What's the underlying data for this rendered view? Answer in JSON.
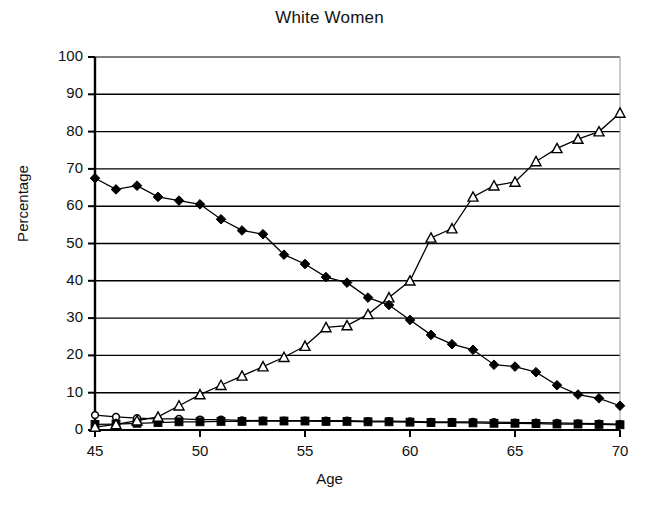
{
  "chart_data": {
    "type": "line",
    "title": "White Women",
    "xlabel": "Age",
    "ylabel": "Percentage",
    "xlim": [
      45,
      70
    ],
    "ylim": [
      0,
      100
    ],
    "xticks": [
      45,
      50,
      55,
      60,
      65,
      70
    ],
    "yticks": [
      0,
      10,
      20,
      30,
      40,
      50,
      60,
      70,
      80,
      90,
      100
    ],
    "grid": true,
    "legend": "none",
    "x": [
      45,
      46,
      47,
      48,
      49,
      50,
      51,
      52,
      53,
      54,
      55,
      56,
      57,
      58,
      59,
      60,
      61,
      62,
      63,
      64,
      65,
      66,
      67,
      68,
      69,
      70
    ],
    "series": [
      {
        "name": "declining-series",
        "marker": "filled-diamond",
        "values": [
          67.5,
          64.5,
          65.5,
          62.5,
          61.5,
          60.5,
          56.5,
          53.5,
          52.5,
          47.0,
          44.5,
          41.0,
          39.5,
          35.5,
          33.5,
          29.5,
          25.5,
          23.0,
          21.5,
          17.5,
          17.0,
          15.5,
          12.0,
          9.5,
          8.5,
          6.5
        ]
      },
      {
        "name": "rising-series",
        "marker": "open-triangle",
        "values": [
          0.8,
          1.5,
          2.5,
          3.5,
          6.5,
          9.5,
          12.0,
          14.5,
          17.0,
          19.5,
          22.5,
          27.5,
          28.0,
          31.0,
          35.5,
          40.0,
          51.5,
          54.0,
          62.5,
          65.5,
          66.5,
          72.0,
          75.5,
          78.0,
          80.0,
          85.0
        ]
      },
      {
        "name": "flat-upper-series",
        "marker": "open-circle",
        "values": [
          4.0,
          3.5,
          3.2,
          3.0,
          3.0,
          2.8,
          2.8,
          2.6,
          2.5,
          2.5,
          2.5,
          2.5,
          2.5,
          2.4,
          2.4,
          2.3,
          2.2,
          2.2,
          2.2,
          2.1,
          2.0,
          2.0,
          1.9,
          1.8,
          1.7,
          1.6
        ]
      },
      {
        "name": "flat-lower-series",
        "marker": "filled-square",
        "values": [
          1.5,
          1.6,
          1.8,
          2.0,
          2.2,
          2.2,
          2.3,
          2.3,
          2.4,
          2.4,
          2.4,
          2.3,
          2.3,
          2.2,
          2.2,
          2.1,
          2.0,
          2.0,
          1.9,
          1.8,
          1.8,
          1.7,
          1.6,
          1.6,
          1.5,
          1.4
        ]
      }
    ]
  },
  "axis": {
    "y_tick_labels": [
      "100",
      "90",
      "80",
      "70",
      "60",
      "50",
      "40",
      "30",
      "20",
      "10",
      "0"
    ],
    "x_tick_labels": [
      "45",
      "50",
      "55",
      "60",
      "65",
      "70"
    ]
  },
  "colors": {
    "line": "#000000",
    "grid": "#000000",
    "axis": "#000000",
    "background": "#ffffff",
    "text": "#111111"
  }
}
